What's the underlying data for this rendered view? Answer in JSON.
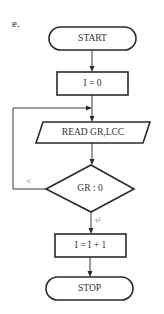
{
  "figure_label": "e.",
  "flowchart": {
    "nodes": [
      {
        "id": "start",
        "type": "terminal",
        "label": "START"
      },
      {
        "id": "init",
        "type": "process",
        "label": "I = 0"
      },
      {
        "id": "read",
        "type": "io",
        "label": "READ GR,LCC"
      },
      {
        "id": "decision",
        "type": "decision",
        "label": "GR : 0"
      },
      {
        "id": "increment",
        "type": "process",
        "label": "I = I + 1"
      },
      {
        "id": "stop",
        "type": "terminal",
        "label": "STOP"
      }
    ],
    "edges": [
      {
        "from": "start",
        "to": "init",
        "label": ""
      },
      {
        "from": "init",
        "to": "read",
        "label": ""
      },
      {
        "from": "read",
        "to": "decision",
        "label": ""
      },
      {
        "from": "decision",
        "to": "read",
        "label": "<"
      },
      {
        "from": "decision",
        "to": "increment",
        "label": "≥"
      },
      {
        "from": "increment",
        "to": "stop",
        "label": ""
      }
    ]
  },
  "colors": {
    "stroke": "#2a2a2a",
    "background": "#ffffff",
    "text": "#333333"
  }
}
